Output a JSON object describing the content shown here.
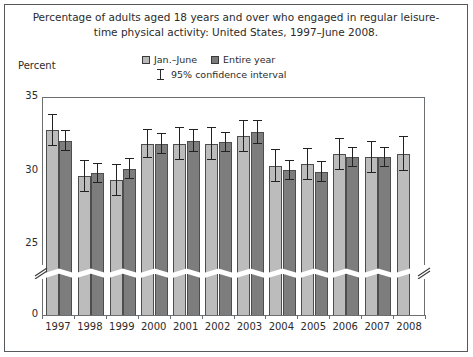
{
  "figure": {
    "title": "Percentage of adults aged 18 years and over who engaged in regular leisure-time physical activity: United States, 1997–June 2008.",
    "y_axis_title": "Percent"
  },
  "legend": {
    "item_light": "Jan.–June",
    "item_dark": "Entire year",
    "item_ci": "95% confidence interval",
    "color_light": "#bcbcbc",
    "color_dark": "#7d7d7d"
  },
  "chart_data": {
    "type": "bar",
    "title": "Percentage of adults aged 18 years and over who engaged in regular leisure-time physical activity: United States, 1997–June 2008.",
    "xlabel": "",
    "ylabel": "Percent",
    "ylim": [
      0,
      35
    ],
    "y_ticks": [
      "0",
      "25",
      "30",
      "35"
    ],
    "y_axis_break": true,
    "y_axis_break_between": [
      0,
      23.5
    ],
    "grid": false,
    "legend_position": "top-center",
    "error_bars": "95% confidence interval",
    "categories": [
      "1997",
      "1998",
      "1999",
      "2000",
      "2001",
      "2002",
      "2003",
      "2004",
      "2005",
      "2006",
      "2007",
      "2008"
    ],
    "series": [
      {
        "name": "Jan.–June",
        "color": "#bcbcbc",
        "values": [
          32.8,
          29.7,
          29.4,
          31.9,
          31.9,
          31.9,
          32.4,
          30.4,
          30.5,
          31.2,
          31.0,
          31.2
        ],
        "ci_low": [
          31.7,
          28.6,
          28.3,
          30.9,
          30.8,
          30.8,
          31.3,
          29.3,
          29.4,
          30.1,
          29.9,
          30.0
        ],
        "ci_high": [
          33.9,
          30.8,
          30.5,
          32.9,
          33.0,
          33.0,
          33.5,
          31.5,
          31.6,
          32.3,
          32.1,
          32.4
        ]
      },
      {
        "name": "Entire year",
        "color": "#7d7d7d",
        "values": [
          32.1,
          29.9,
          30.2,
          31.9,
          32.1,
          32.0,
          32.7,
          30.1,
          30.0,
          31.0,
          31.0,
          null
        ],
        "ci_low": [
          31.4,
          29.2,
          29.5,
          31.2,
          31.3,
          31.3,
          31.9,
          29.4,
          29.3,
          30.3,
          30.3,
          null
        ],
        "ci_high": [
          32.8,
          30.6,
          30.9,
          32.6,
          32.9,
          32.7,
          33.5,
          30.8,
          30.7,
          31.7,
          31.7,
          null
        ]
      }
    ]
  }
}
